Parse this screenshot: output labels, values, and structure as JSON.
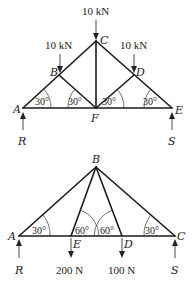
{
  "truss1": {
    "nodes": {
      "A": "A",
      "B": "B",
      "C": "C",
      "D": "D",
      "E": "E",
      "F": "F"
    },
    "loads": {
      "at_C": "10 kN",
      "at_B": "10 kN",
      "at_D": "10 kN"
    },
    "reactions": {
      "left": "R",
      "right": "S"
    },
    "angles": [
      "30°",
      "30°",
      "30°",
      "30°"
    ]
  },
  "truss2": {
    "nodes": {
      "A": "A",
      "B": "B",
      "C": "C",
      "D": "D",
      "E": "E"
    },
    "loads": {
      "at_E": "200 N",
      "at_D": "100 N"
    },
    "reactions": {
      "left": "R",
      "right": "S"
    },
    "angles": [
      "30°",
      "60°",
      "60°",
      "30°"
    ]
  }
}
